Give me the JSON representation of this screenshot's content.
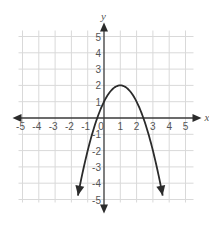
{
  "chart_data": {
    "type": "line",
    "title": "",
    "xlabel": "x",
    "ylabel": "y",
    "xlim": [
      -5,
      5
    ],
    "ylim": [
      -5,
      5
    ],
    "grid": true,
    "x_ticks": [
      -5,
      -4,
      -3,
      -2,
      -1,
      0,
      1,
      2,
      3,
      4,
      5
    ],
    "y_ticks": [
      -5,
      -4,
      -3,
      -2,
      -1,
      1,
      2,
      3,
      4,
      5
    ],
    "x_tick_labels": [
      "-5",
      "-4",
      "-3",
      "-2",
      "-1",
      "0",
      "1",
      "2",
      "3",
      "4",
      "5"
    ],
    "y_tick_labels": [
      "-5",
      "-4",
      "-3",
      "-2",
      "-1",
      "1",
      "2",
      "3",
      "4",
      "5"
    ],
    "series": [
      {
        "name": "parabola",
        "equation": "y = -(x - 1)^2 + 2",
        "vertex": [
          1,
          2
        ],
        "y_intercept": 1,
        "x_intercepts": [
          -0.41,
          2.41
        ],
        "x_range": [
          -1.6,
          3.6
        ],
        "arrows_at_ends": true,
        "color": "#2b2b2b"
      }
    ]
  }
}
